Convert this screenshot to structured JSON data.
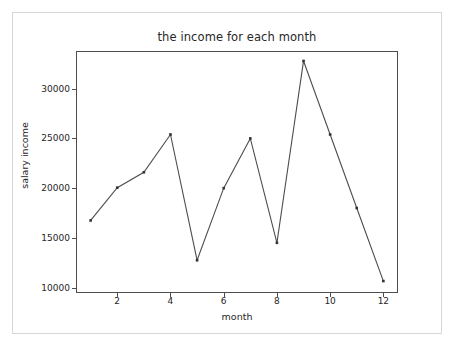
{
  "chart_data": {
    "type": "line",
    "title": "the income for each month",
    "xlabel": "month",
    "ylabel": "salary income",
    "x": [
      1,
      2,
      3,
      4,
      5,
      6,
      7,
      8,
      9,
      10,
      11,
      12
    ],
    "values": [
      16750,
      20050,
      21600,
      25400,
      12750,
      20000,
      25000,
      14500,
      32800,
      25400,
      18000,
      10650
    ],
    "series": [
      {
        "name": "salary income",
        "values": [
          16750,
          20050,
          21600,
          25400,
          12750,
          20000,
          25000,
          14500,
          32800,
          25400,
          18000,
          10650
        ]
      }
    ],
    "xticks": [
      "2",
      "4",
      "6",
      "8",
      "10",
      "12"
    ],
    "xtick_values": [
      2,
      4,
      6,
      8,
      10,
      12
    ],
    "yticks": [
      "10000",
      "15000",
      "20000",
      "25000",
      "30000"
    ],
    "ytick_values": [
      10000,
      15000,
      20000,
      25000,
      30000
    ],
    "xlim": [
      0.45,
      12.55
    ],
    "ylim": [
      9450,
      33800
    ],
    "grid": false,
    "legend": null,
    "marker": "square",
    "line_color": "#4d4d4d",
    "marker_color": "#333333",
    "axes_color": "#4d4d4d",
    "background_color": "#ffffff",
    "frame_color": "#d7d7d7"
  }
}
